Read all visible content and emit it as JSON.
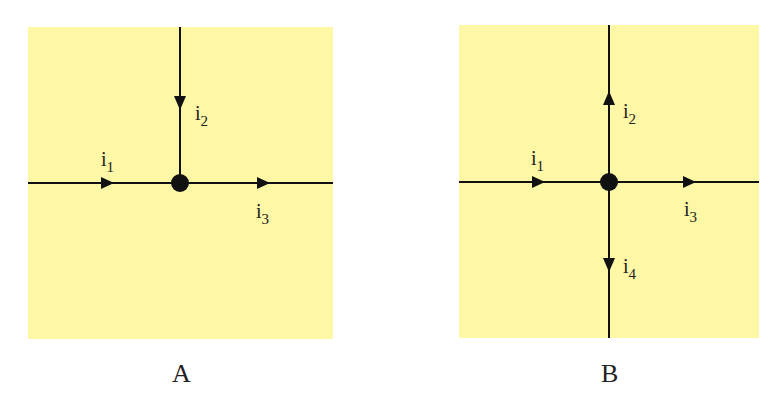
{
  "colors": {
    "panel_bg": "#fdf7a6",
    "line": "#111111",
    "text": "#222222"
  },
  "panels": [
    {
      "caption": "A",
      "currents": [
        {
          "base": "i",
          "sub": "1",
          "direction": "into node (left to right)"
        },
        {
          "base": "i",
          "sub": "2",
          "direction": "into node (top to bottom)"
        },
        {
          "base": "i",
          "sub": "3",
          "direction": "out of node (left to right)"
        }
      ]
    },
    {
      "caption": "B",
      "currents": [
        {
          "base": "i",
          "sub": "1",
          "direction": "into node (left to right)"
        },
        {
          "base": "i",
          "sub": "2",
          "direction": "out of node (upward)"
        },
        {
          "base": "i",
          "sub": "3",
          "direction": "out of node (left to right)"
        },
        {
          "base": "i",
          "sub": "4",
          "direction": "out of node (downward)"
        }
      ]
    }
  ]
}
